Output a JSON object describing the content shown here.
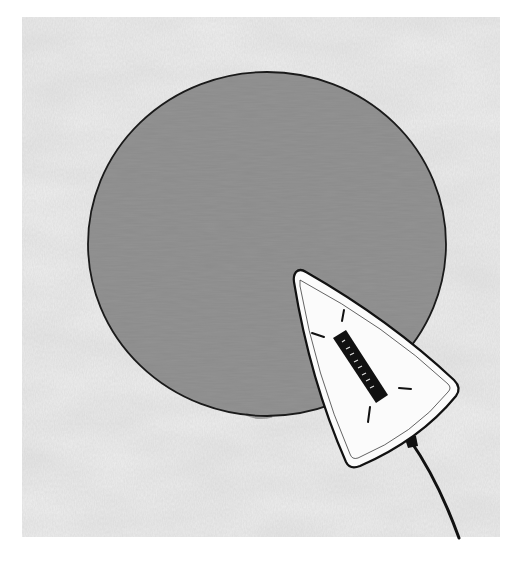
{
  "image": {
    "alt": "Illustration of a white clothes iron pressing a round grey fabric patch on a textured light cloth background",
    "width": 514,
    "height": 564
  },
  "colors": {
    "page_background": "#ffffff",
    "cloth_base": "#ececec",
    "cloth_shadow": "#d4d4d4",
    "patch_fill": "#8a8a8a",
    "patch_outline": "#1a1a1a",
    "iron_fill": "#fbfbfb",
    "iron_outline": "#111111",
    "cord": "#111111"
  },
  "scene": {
    "cloth": {
      "x": 22,
      "y": 17,
      "width": 478,
      "height": 520
    },
    "patch": {
      "cx": 267,
      "cy": 244,
      "rx": 179,
      "ry": 172
    },
    "iron": {
      "tip": [
        296,
        272
      ],
      "right_corner": [
        458,
        390
      ],
      "bottom_corner": [
        352,
        468
      ],
      "vent_label": "heat-vent",
      "heat_marks": 4
    },
    "cord": {
      "start": [
        410,
        440
      ],
      "end": [
        459,
        538
      ]
    }
  }
}
